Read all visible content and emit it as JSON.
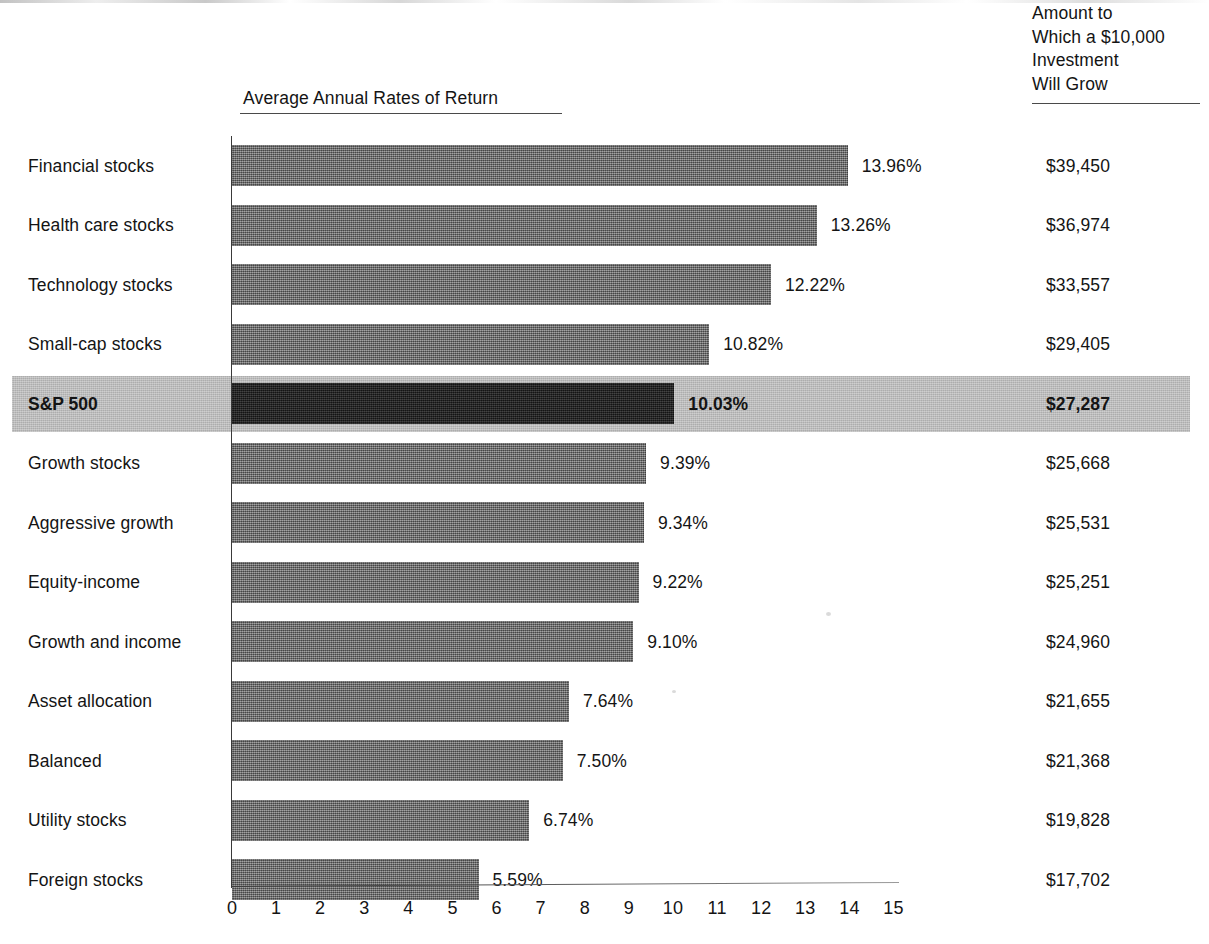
{
  "chart_data": {
    "type": "bar",
    "title": "Average Annual Rates of Return",
    "xlabel": "",
    "ylabel": "",
    "orientation": "horizontal",
    "xlim": [
      0,
      15
    ],
    "grid": false,
    "legend": false,
    "xticks": [
      "0",
      "1",
      "2",
      "3",
      "4",
      "5",
      "6",
      "7",
      "8",
      "9",
      "10",
      "11",
      "12",
      "13",
      "14",
      "15"
    ],
    "categories": [
      "Financial stocks",
      "Health care stocks",
      "Technology stocks",
      "Small-cap stocks",
      "S&P 500",
      "Growth stocks",
      "Aggressive growth",
      "Equity-income",
      "Growth and income",
      "Asset allocation",
      "Balanced",
      "Utility stocks",
      "Foreign stocks"
    ],
    "values": [
      13.96,
      13.26,
      12.22,
      10.82,
      10.03,
      9.39,
      9.34,
      9.22,
      9.1,
      7.64,
      7.5,
      6.74,
      5.59
    ],
    "value_labels": [
      "13.96%",
      "13.26%",
      "12.22%",
      "10.82%",
      "10.03%",
      "9.39%",
      "9.34%",
      "9.22%",
      "9.10%",
      "7.64%",
      "7.50%",
      "6.74%",
      "5.59%"
    ],
    "series": [
      {
        "name": "Amount to Which a $10,000 Investment Will Grow",
        "values": [
          39450,
          36974,
          33557,
          29405,
          27287,
          25668,
          25531,
          25251,
          24960,
          21655,
          21368,
          19828,
          17702
        ],
        "labels": [
          "$39,450",
          "$36,974",
          "$33,557",
          "$29,405",
          "$27,287",
          "$25,668",
          "$25,531",
          "$25,251",
          "$24,960",
          "$21,655",
          "$21,368",
          "$19,828",
          "$17,702"
        ]
      }
    ],
    "highlight_index": 4,
    "annotations": {
      "highlight_note": "S&P 500 row is shaded and its bar rendered in black"
    }
  },
  "amount_header": {
    "line1": "Amount to",
    "line2": "Which a $10,000",
    "line3": "Investment",
    "line4": "Will Grow"
  },
  "colors": {
    "bar_fill": "#6e6e6e",
    "bar_highlight_fill": "#1c1c1c",
    "row_highlight_band": "#bdbdbd",
    "axis": "#3a3a3a",
    "text": "#141414",
    "background": "#ffffff"
  }
}
